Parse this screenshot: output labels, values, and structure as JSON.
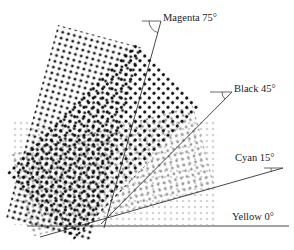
{
  "figure": {
    "screens": [
      {
        "id": "magenta",
        "label": "Magenta 75°",
        "angle_deg": 75,
        "dot_color": "#1e1e1e"
      },
      {
        "id": "black",
        "label": "Black 45°",
        "angle_deg": 45,
        "dot_color": "#0d0d0d"
      },
      {
        "id": "cyan",
        "label": "Cyan 15°",
        "angle_deg": 15,
        "dot_color": "#9a9a9a"
      },
      {
        "id": "yellow",
        "label": "Yellow 0°",
        "angle_deg": 0,
        "dot_color": "#d4d4d4"
      }
    ]
  }
}
